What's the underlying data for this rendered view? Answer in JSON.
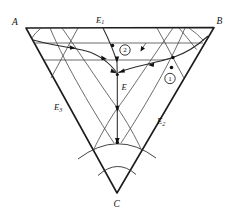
{
  "figure": {
    "background_color": "#ffffff",
    "line_color": "#1c1c1c",
    "vertex_labels": {
      "top_left": "A",
      "top_right": "B",
      "bottom": "C"
    },
    "eutectic_labels": {
      "binary_top": {
        "main": "E",
        "sub": "1"
      },
      "binary_right": {
        "main": "E",
        "sub": "2"
      },
      "binary_left": {
        "main": "E",
        "sub": "3"
      },
      "ternary": "E"
    },
    "sample_points": {
      "sample_1": {
        "label": "1"
      },
      "sample_2": {
        "label": "2"
      }
    }
  }
}
